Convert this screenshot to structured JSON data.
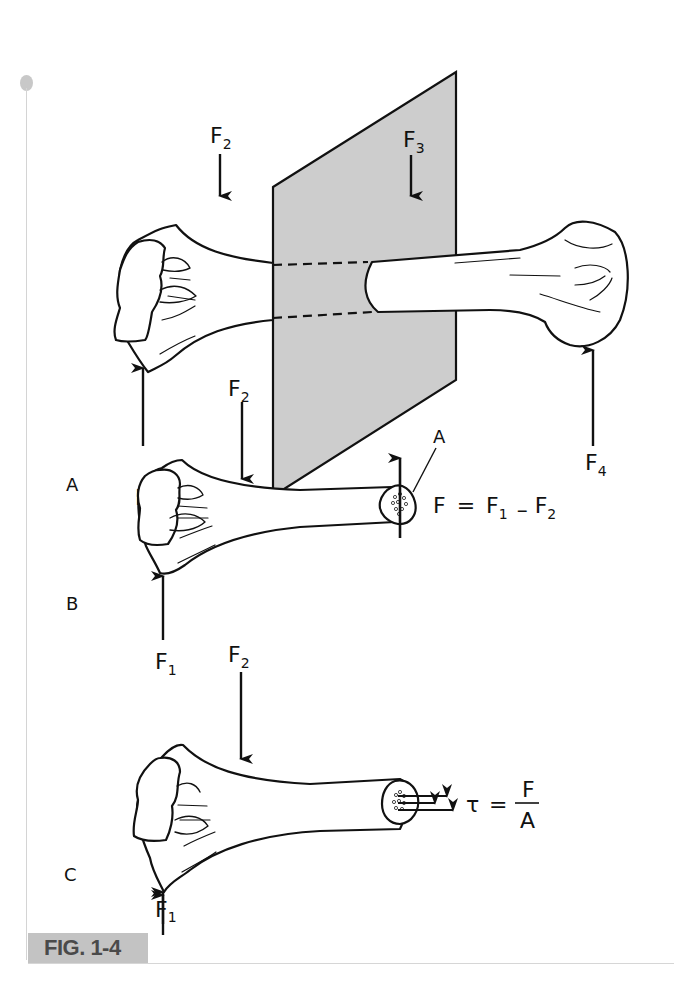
{
  "figure": {
    "caption": "FIG. 1-4",
    "accent_color": "#c3c3c3",
    "plane_color": "#cdcdcd"
  },
  "panels": [
    {
      "id": "A",
      "label": "A",
      "description": "Bone loaded by forces with a cutting plane through the shaft",
      "forces": [
        {
          "name": "F",
          "sub": "1",
          "direction": "up"
        },
        {
          "name": "F",
          "sub": "2",
          "direction": "down"
        },
        {
          "name": "F",
          "sub": "3",
          "direction": "down"
        },
        {
          "name": "F",
          "sub": "4",
          "direction": "up"
        }
      ]
    },
    {
      "id": "B",
      "label": "B",
      "description": "Free body of cut section showing resultant internal force",
      "forces": [
        {
          "name": "F",
          "sub": "1",
          "direction": "up"
        },
        {
          "name": "F",
          "sub": "2",
          "direction": "down"
        }
      ],
      "area_label": "A",
      "equation": {
        "lhs": "F",
        "eq": "=",
        "t1": "F",
        "t1_sub": "1",
        "op": "–",
        "t2": "F",
        "t2_sub": "2"
      }
    },
    {
      "id": "C",
      "label": "C",
      "description": "Shear stress distributed over the cut area",
      "forces": [
        {
          "name": "F",
          "sub": "1",
          "direction": "up"
        },
        {
          "name": "F",
          "sub": "2",
          "direction": "down"
        }
      ],
      "equation": {
        "lhs": "τ",
        "eq": "=",
        "numerator": "F",
        "denominator": "A"
      }
    }
  ]
}
